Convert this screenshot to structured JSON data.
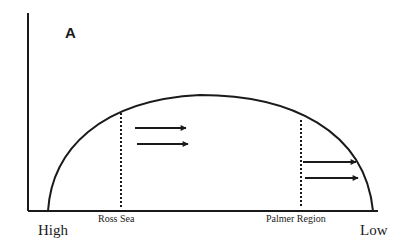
{
  "figure": {
    "panel_label": "A",
    "x_axis": {
      "left_label": "High",
      "right_label": "Low"
    },
    "regions": [
      {
        "name": "Ross Sea",
        "x": 121
      },
      {
        "name": "Palmer Region",
        "x": 301
      }
    ],
    "arrows": [
      {
        "region": "Ross Sea",
        "direction": "right",
        "count": 2
      },
      {
        "region": "Palmer Region",
        "direction": "right",
        "count": 2
      }
    ],
    "colors": {
      "line": "#1a1a1a",
      "background": "#ffffff"
    }
  }
}
